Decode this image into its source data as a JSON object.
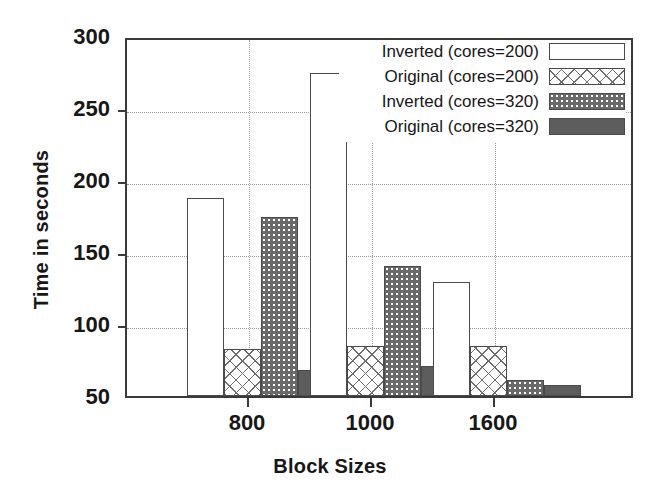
{
  "chart_data": {
    "type": "bar",
    "title": "",
    "xlabel": "Block Sizes",
    "ylabel": "Time in seconds",
    "categories": [
      "800",
      "1000",
      "1600"
    ],
    "series": [
      {
        "name": "Inverted (cores=200)",
        "pattern": "empty",
        "values": [
          189,
          277,
          130
        ]
      },
      {
        "name": "Original (cores=200)",
        "pattern": "cross",
        "values": [
          83,
          85,
          85
        ]
      },
      {
        "name": "Inverted (cores=320)",
        "pattern": "dots",
        "values": [
          176,
          141,
          61
        ]
      },
      {
        "name": "Original (cores=320)",
        "pattern": "solid",
        "values": [
          68,
          71,
          58
        ]
      }
    ],
    "ylim": [
      50,
      300
    ],
    "yticks": [
      50,
      100,
      150,
      200,
      250,
      300
    ],
    "ytick_labels": [
      "50",
      "100",
      "150",
      "200",
      "250",
      "300"
    ],
    "grid": "horizontal-and-vertical-dotted",
    "legend_position": "top-right"
  },
  "axes": {
    "y_title": "Time in seconds",
    "x_title": "Block Sizes",
    "y_tick_labels": [
      "300",
      "250",
      "200",
      "150",
      "100",
      "50"
    ],
    "x_tick_labels": [
      "800",
      "1000",
      "1600"
    ]
  },
  "legend": {
    "items": [
      {
        "label": "Inverted (cores=200)",
        "swatch": "empty-rect-swatch"
      },
      {
        "label": "Original (cores=200)",
        "swatch": "crosshatch-rect-swatch"
      },
      {
        "label": "Inverted (cores=320)",
        "swatch": "dotted-rect-swatch"
      },
      {
        "label": "Original (cores=320)",
        "swatch": "solid-rect-swatch"
      }
    ]
  },
  "colors": {
    "axis": "#3a3a3a",
    "grid": "#9a9a9a",
    "solid_fill": "#5d5d5d",
    "dots_fill": "#6a6a6a",
    "cross_stroke": "#6e6e6e",
    "background": "#ffffff",
    "text": "#171717"
  }
}
